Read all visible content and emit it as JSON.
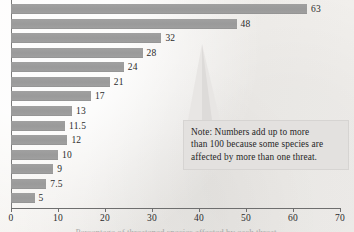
{
  "chart_data": {
    "type": "bar",
    "orientation": "horizontal",
    "title": "",
    "xlabel": "Percentage of threatened species",
    "ylabel": "",
    "xlim": [
      0,
      70
    ],
    "xticks": [
      0,
      10,
      20,
      30,
      40,
      50,
      60,
      70
    ],
    "xtick_labels": [
      "0",
      "10",
      "20",
      "30",
      "40",
      "50",
      "60",
      "70"
    ],
    "grid": false,
    "legend": "none",
    "categories": [
      "",
      "",
      "",
      "",
      "",
      "",
      "",
      "",
      "",
      "",
      "",
      "",
      "",
      ""
    ],
    "values": [
      63,
      48,
      32,
      28,
      24,
      21,
      17,
      13,
      11.5,
      12,
      10,
      9,
      7.5,
      5
    ],
    "value_labels": [
      "63",
      "48",
      "32",
      "28",
      "24",
      "21",
      "17",
      "13",
      "11.5",
      "12",
      "10",
      "9",
      "7.5",
      "5"
    ],
    "bar_color": "#9a9a9a",
    "annotations": [
      {
        "name": "note",
        "text": "Note: Numbers add up to more than 100 because some species are affected by more than one threat."
      }
    ]
  },
  "note": {
    "line1": "Note: Numbers add up to more",
    "line2": "than 100 because some species are",
    "line3": "affected by more than one threat."
  },
  "axis": {
    "title_cropped": "Percentage of threatened species affected by each threat"
  },
  "colors": {
    "bar": "#9a9a9a",
    "note_bg": "#e3e1df",
    "axis": "#6e6e6e",
    "text": "#2b2b2b",
    "paper": "#f2f0ed"
  }
}
